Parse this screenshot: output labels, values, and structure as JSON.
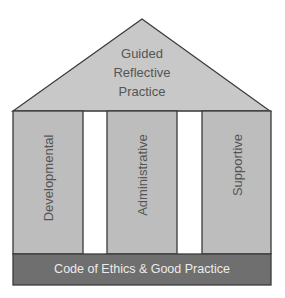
{
  "diagram": {
    "roof": {
      "label_lines": [
        "Guided",
        "Reflective",
        "Practice"
      ],
      "fill": "#c8c8c8"
    },
    "pillars": [
      {
        "label": "Developmental",
        "fill": "#bdbdbd"
      },
      {
        "label": "Administrative",
        "fill": "#bdbdbd"
      },
      {
        "label": "Supportive",
        "fill": "#bdbdbd"
      }
    ],
    "base": {
      "label": "Code of Ethics & Good Practice",
      "fill": "#6f6f6f"
    },
    "stroke": "#3a3a3a"
  }
}
